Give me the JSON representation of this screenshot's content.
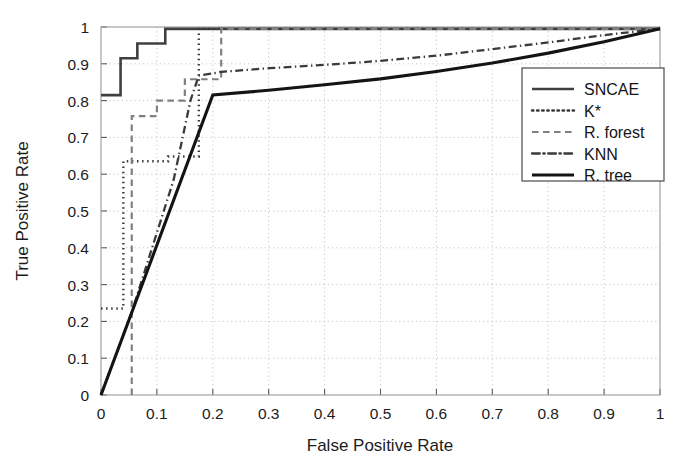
{
  "chart_data": {
    "type": "line",
    "title": "",
    "xlabel": "False Positive Rate",
    "ylabel": "True Positive Rate",
    "xlim": [
      0,
      1
    ],
    "ylim": [
      0,
      1
    ],
    "grid": true,
    "legend_position": "right",
    "xticks": [
      "0",
      "0.1",
      "0.2",
      "0.3",
      "0.4",
      "0.5",
      "0.6",
      "0.7",
      "0.8",
      "0.9",
      "1"
    ],
    "xtick_values": [
      0,
      0.1,
      0.2,
      0.3,
      0.4,
      0.5,
      0.6,
      0.7,
      0.8,
      0.9,
      1
    ],
    "yticks": [
      "0",
      "0.1",
      "0.2",
      "0.3",
      "0.4",
      "0.5",
      "0.6",
      "0.7",
      "0.8",
      "0.9",
      "1"
    ],
    "ytick_values": [
      0,
      0.1,
      0.2,
      0.3,
      0.4,
      0.5,
      0.6,
      0.7,
      0.8,
      0.9,
      1
    ],
    "series": [
      {
        "name": "SNCAE",
        "style": "solid",
        "width": 2.6,
        "color": "#404040",
        "points": [
          [
            0.0,
            0.815
          ],
          [
            0.035,
            0.815
          ],
          [
            0.035,
            0.915
          ],
          [
            0.065,
            0.915
          ],
          [
            0.065,
            0.955
          ],
          [
            0.115,
            0.955
          ],
          [
            0.115,
            0.995
          ],
          [
            1.0,
            0.995
          ]
        ]
      },
      {
        "name": "K*",
        "style": "dotted",
        "width": 2.4,
        "color": "#3a3a3a",
        "points": [
          [
            0.0,
            0.235
          ],
          [
            0.04,
            0.235
          ],
          [
            0.04,
            0.635
          ],
          [
            0.12,
            0.635
          ],
          [
            0.12,
            0.648
          ],
          [
            0.175,
            0.648
          ],
          [
            0.175,
            0.995
          ],
          [
            1.0,
            0.995
          ]
        ]
      },
      {
        "name": "R. forest",
        "style": "dashed",
        "width": 2.2,
        "color": "#808080",
        "points": [
          [
            0.055,
            0.0
          ],
          [
            0.055,
            0.758
          ],
          [
            0.1,
            0.758
          ],
          [
            0.1,
            0.8
          ],
          [
            0.15,
            0.8
          ],
          [
            0.15,
            0.858
          ],
          [
            0.215,
            0.858
          ],
          [
            0.215,
            0.995
          ],
          [
            1.0,
            0.995
          ]
        ]
      },
      {
        "name": "KNN",
        "style": "dashdot",
        "width": 2.3,
        "color": "#3a3a3a",
        "points": [
          [
            0.0,
            0.0
          ],
          [
            0.055,
            0.225
          ],
          [
            0.13,
            0.585
          ],
          [
            0.16,
            0.8
          ],
          [
            0.175,
            0.868
          ],
          [
            0.215,
            0.878
          ],
          [
            0.3,
            0.888
          ],
          [
            0.4,
            0.897
          ],
          [
            0.5,
            0.908
          ],
          [
            0.6,
            0.922
          ],
          [
            0.7,
            0.94
          ],
          [
            0.8,
            0.958
          ],
          [
            0.9,
            0.978
          ],
          [
            1.0,
            0.995
          ]
        ]
      },
      {
        "name": "R. tree",
        "style": "solid",
        "width": 3.1,
        "color": "#141414",
        "points": [
          [
            0.0,
            0.0
          ],
          [
            0.2,
            0.815
          ],
          [
            0.3,
            0.828
          ],
          [
            0.4,
            0.843
          ],
          [
            0.5,
            0.859
          ],
          [
            0.6,
            0.879
          ],
          [
            0.7,
            0.902
          ],
          [
            0.8,
            0.929
          ],
          [
            0.9,
            0.96
          ],
          [
            1.0,
            0.995
          ]
        ]
      }
    ]
  },
  "legend": {
    "entries": [
      "SNCAE",
      "K*",
      "R. forest",
      "KNN",
      "R. tree"
    ]
  }
}
